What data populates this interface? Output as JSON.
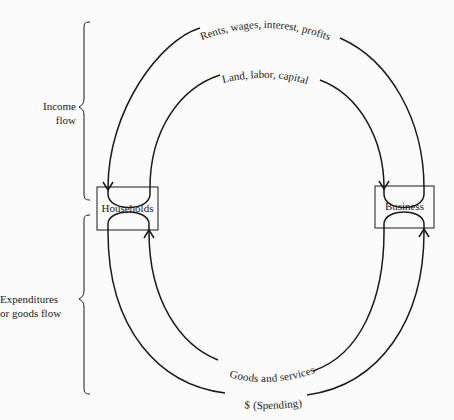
{
  "diagram": {
    "nodes": {
      "households": "Households",
      "business": "Business"
    },
    "flows": {
      "outer_top": "Rents, wages, interest, profits",
      "inner_top": "Land, labor, capital",
      "inner_bottom": "Goods and services",
      "outer_bottom": "$ (Spending)"
    },
    "brackets": {
      "income_line1": "Income",
      "income_line2": "flow",
      "expend_line1": "Expenditures",
      "expend_line2": "or goods flow"
    },
    "colors": {
      "line": "#1a1a1a",
      "background": "#fbfbfb"
    }
  }
}
